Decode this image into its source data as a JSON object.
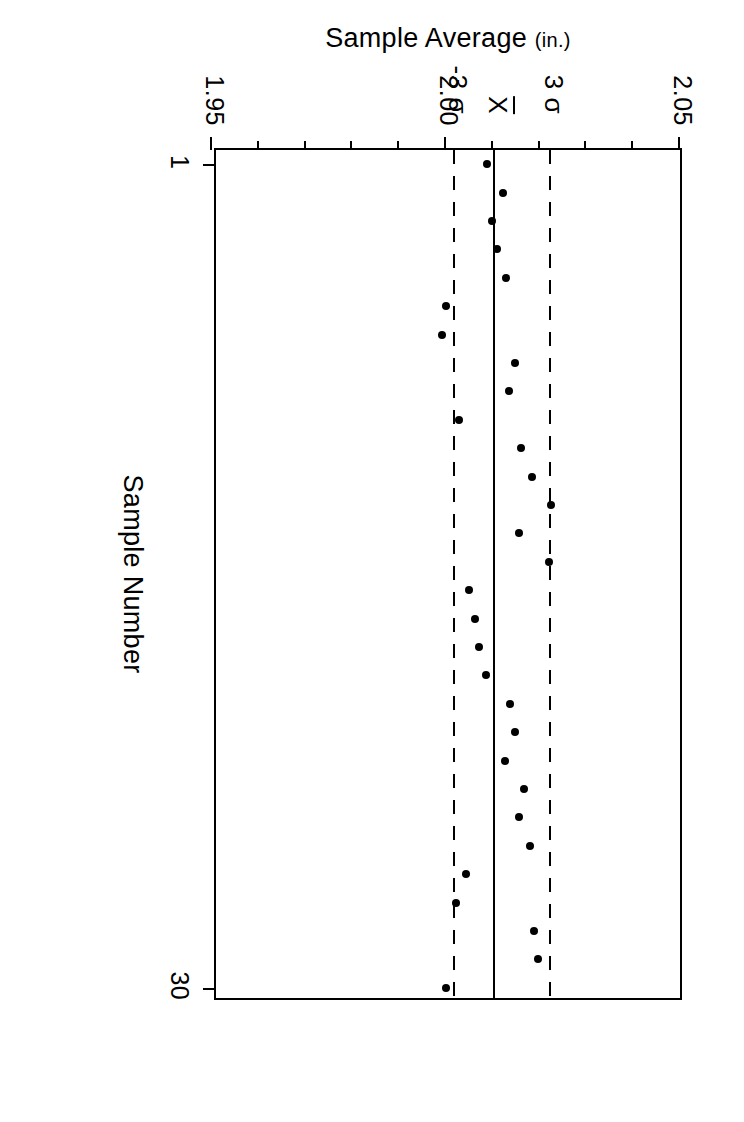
{
  "figure": {
    "type": "control-chart",
    "x_axis": {
      "title": "Sample Number",
      "ticks": [
        {
          "label": "1",
          "value": 1
        },
        {
          "label": "30",
          "value": 30
        }
      ]
    },
    "y_axis": {
      "title": "Sample  Average",
      "units": "(in.)",
      "ticks": [
        {
          "label": "2.05",
          "value": 2.05
        },
        {
          "label": "2.00",
          "value": 2.0
        },
        {
          "label": "1.95",
          "value": 1.95
        }
      ]
    },
    "limit_labels": {
      "ucl": "3 σ",
      "center": "X",
      "lcl": "-3 σ"
    }
  },
  "chart_data": {
    "type": "scatter",
    "title": "",
    "subtitle": "",
    "xlabel": "Sample Number",
    "ylabel": "Sample Average (in.)",
    "xlim": [
      0.5,
      30.5
    ],
    "ylim": [
      1.95,
      2.05
    ],
    "xticks": [
      1,
      30
    ],
    "yticks": [
      2.05,
      2.0,
      1.95
    ],
    "yticks_minor": [
      2.04,
      2.03,
      2.02,
      2.01,
      1.99,
      1.98,
      1.97,
      1.96
    ],
    "grid": false,
    "legend": null,
    "reference_lines": [
      {
        "name": "ucl",
        "label": "3 σ",
        "value": 2.0225,
        "style": "dashed"
      },
      {
        "name": "center",
        "label": "X̄",
        "value": 2.0105,
        "style": "solid"
      },
      {
        "name": "lcl",
        "label": "-3 σ",
        "value": 2.002,
        "style": "dashed"
      }
    ],
    "x": [
      1,
      2,
      3,
      4,
      5,
      6,
      7,
      8,
      9,
      10,
      11,
      12,
      13,
      14,
      15,
      16,
      17,
      18,
      19,
      20,
      21,
      22,
      23,
      24,
      25,
      26,
      27,
      28,
      29,
      30
    ],
    "series": [
      {
        "name": "Sample Average",
        "marker": "filled-circle",
        "color": "#000000",
        "values": [
          2.0088,
          2.0122,
          2.0099,
          2.011,
          2.0128,
          2.0,
          1.9992,
          2.0148,
          2.0134,
          2.0028,
          2.016,
          2.0183,
          2.0224,
          2.0157,
          2.022,
          2.005,
          2.0062,
          2.007,
          2.0085,
          2.0137,
          2.0147,
          2.0127,
          2.0167,
          2.0157,
          2.018,
          2.0043,
          2.0022,
          2.0188,
          2.0197,
          2.0
        ]
      }
    ]
  }
}
